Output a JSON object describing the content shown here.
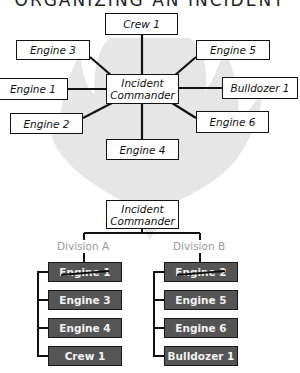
{
  "title": "ORGANIZING AN INCIDENT",
  "top_diagram": {
    "center": {
      "label": "Incident Commander",
      "line1": "Incident",
      "line2": "Commander"
    },
    "resources": [
      {
        "id": "crew1",
        "label": "Crew 1"
      },
      {
        "id": "engine3",
        "label": "Engine 3"
      },
      {
        "id": "engine5",
        "label": "Engine 5"
      },
      {
        "id": "engine1",
        "label": "Engine 1"
      },
      {
        "id": "bulldozer1",
        "label": "Bulldozer 1"
      },
      {
        "id": "engine2",
        "label": "Engine 2"
      },
      {
        "id": "engine6",
        "label": "Engine 6"
      },
      {
        "id": "engine4",
        "label": "Engine 4"
      }
    ]
  },
  "bottom_diagram": {
    "commander": {
      "line1": "Incident",
      "line2": "Commander"
    },
    "divisions": [
      {
        "name": "Division A",
        "supervisor": {
          "label": "Engine 1",
          "struck": true
        },
        "members": [
          {
            "label": "Engine 3"
          },
          {
            "label": "Engine 4"
          },
          {
            "label": "Crew 1"
          }
        ]
      },
      {
        "name": "Division B",
        "supervisor": {
          "label": "Engine 2",
          "struck": true
        },
        "members": [
          {
            "label": "Engine 5"
          },
          {
            "label": "Engine 6"
          },
          {
            "label": "Bulldozer 1"
          }
        ]
      }
    ]
  },
  "colors": {
    "box_dark": "#555555",
    "division_label": "#9a9a9a",
    "flame": "#e6e6e6",
    "line": "#111111"
  }
}
